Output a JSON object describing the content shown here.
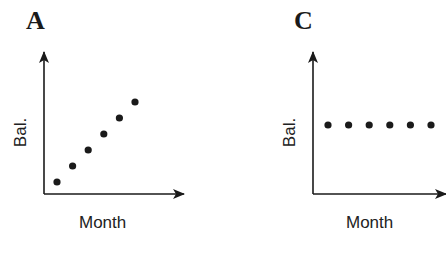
{
  "chart_data": [
    {
      "type": "scatter",
      "title": "A",
      "xlabel": "Month",
      "ylabel": "Bal.",
      "grid": false,
      "x": [
        1,
        2,
        3,
        4,
        5,
        6
      ],
      "values": [
        1,
        2,
        3,
        4,
        5,
        6
      ],
      "description": "Balance increases linearly each month"
    },
    {
      "type": "scatter",
      "title": "C",
      "xlabel": "Month",
      "ylabel": "Bal.",
      "grid": false,
      "x": [
        1,
        2,
        3,
        4,
        5,
        6
      ],
      "values": [
        4.5,
        4.5,
        4.5,
        4.5,
        4.5,
        4.5
      ],
      "description": "Balance stays constant each month"
    }
  ],
  "panels": {
    "a": {
      "letter": "A",
      "xlabel": "Month",
      "ylabel": "Bal."
    },
    "c": {
      "letter": "C",
      "xlabel": "Month",
      "ylabel": "Bal."
    }
  },
  "colors": {
    "ink": "#1a1a1a",
    "background": "#ffffff"
  }
}
